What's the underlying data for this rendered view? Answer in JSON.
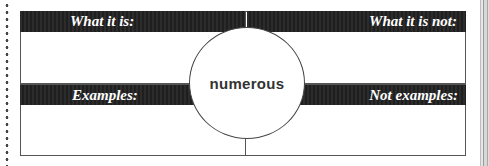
{
  "organizer": {
    "center_word": "numerous",
    "quadrants": {
      "top_left": {
        "label": "What it is:"
      },
      "top_right": {
        "label": "What it is not:"
      },
      "bottom_left": {
        "label": "Examples:"
      },
      "bottom_right": {
        "label": "Not examples:"
      }
    }
  },
  "colors": {
    "header_bar": "#262626",
    "border": "#555555",
    "text_light": "#ffffff",
    "center_text": "#333333"
  }
}
